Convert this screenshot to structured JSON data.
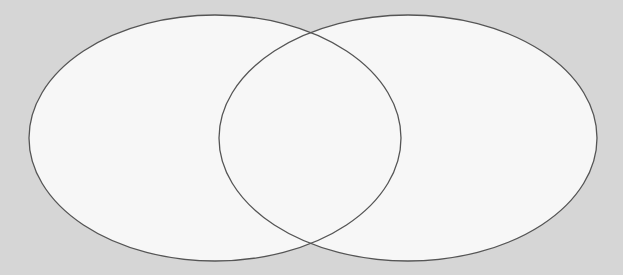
{
  "diagram": {
    "type": "venn",
    "sets": [
      {
        "id": "left",
        "label": "",
        "cx": 215,
        "cy": 138,
        "rx": 186,
        "ry": 123
      },
      {
        "id": "right",
        "label": "",
        "cx": 408,
        "cy": 138,
        "rx": 189,
        "ry": 123
      }
    ],
    "intersection_label": "",
    "colors": {
      "background": "#d6d6d6",
      "fill": "#f7f7f7",
      "stroke": "#555555"
    },
    "stroke_width": 1.3
  }
}
